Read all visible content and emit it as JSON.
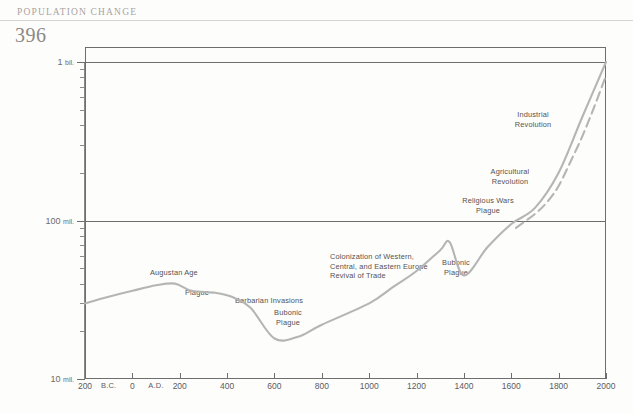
{
  "page": {
    "running_head": "POPULATION CHANGE",
    "folio": "396"
  },
  "chart_data": {
    "type": "line",
    "title": "",
    "xlabel": "",
    "ylabel": "",
    "scale": "log",
    "grid": false,
    "legend": "none",
    "xlim": [
      -200,
      2000
    ],
    "ylim": [
      10000000,
      1000000000
    ],
    "x_ticks": [
      {
        "value": -200,
        "label": "200"
      },
      {
        "value": -100,
        "label": "B.C."
      },
      {
        "value": 0,
        "label": "0"
      },
      {
        "value": 100,
        "label": "A.D."
      },
      {
        "value": 200,
        "label": "200"
      },
      {
        "value": 400,
        "label": "400"
      },
      {
        "value": 600,
        "label": "600"
      },
      {
        "value": 800,
        "label": "800"
      },
      {
        "value": 1000,
        "label": "1000"
      },
      {
        "value": 1200,
        "label": "1200"
      },
      {
        "value": 1400,
        "label": "1400"
      },
      {
        "value": 1600,
        "label": "1600"
      },
      {
        "value": 1800,
        "label": "1800"
      },
      {
        "value": 2000,
        "label": "2000"
      }
    ],
    "y_ticks": [
      {
        "value": 1000000000,
        "label": "1",
        "unit": "bil."
      },
      {
        "value": 100000000,
        "label": "100",
        "unit": "mil."
      },
      {
        "value": 10000000,
        "label": "10",
        "unit": "mil."
      }
    ],
    "series": [
      {
        "name": "European population (estimated)",
        "style": "solid",
        "color": "#b5b5b5",
        "points": [
          {
            "x": -200,
            "y": 30000000
          },
          {
            "x": -100,
            "y": 33000000
          },
          {
            "x": 0,
            "y": 36000000
          },
          {
            "x": 100,
            "y": 39000000
          },
          {
            "x": 180,
            "y": 40000000
          },
          {
            "x": 250,
            "y": 36000000
          },
          {
            "x": 350,
            "y": 35000000
          },
          {
            "x": 420,
            "y": 33000000
          },
          {
            "x": 500,
            "y": 28000000
          },
          {
            "x": 600,
            "y": 18000000
          },
          {
            "x": 700,
            "y": 18500000
          },
          {
            "x": 800,
            "y": 22000000
          },
          {
            "x": 1000,
            "y": 30000000
          },
          {
            "x": 1100,
            "y": 38000000
          },
          {
            "x": 1200,
            "y": 48000000
          },
          {
            "x": 1300,
            "y": 65000000
          },
          {
            "x": 1340,
            "y": 73000000
          },
          {
            "x": 1400,
            "y": 45000000
          },
          {
            "x": 1500,
            "y": 68000000
          },
          {
            "x": 1600,
            "y": 95000000
          },
          {
            "x": 1700,
            "y": 120000000
          },
          {
            "x": 1800,
            "y": 200000000
          },
          {
            "x": 1900,
            "y": 450000000
          },
          {
            "x": 2000,
            "y": 1000000000
          }
        ]
      },
      {
        "name": "Projected / alternate trend",
        "style": "dashed",
        "color": "#b5b5b5",
        "points": [
          {
            "x": 1620,
            "y": 90000000
          },
          {
            "x": 1700,
            "y": 110000000
          },
          {
            "x": 1750,
            "y": 130000000
          },
          {
            "x": 1800,
            "y": 165000000
          },
          {
            "x": 1850,
            "y": 235000000
          },
          {
            "x": 1900,
            "y": 340000000
          },
          {
            "x": 1950,
            "y": 520000000
          },
          {
            "x": 2000,
            "y": 820000000
          }
        ]
      }
    ],
    "annotations": [
      {
        "text": "Augustan Age",
        "x": 150,
        "y": 268
      },
      {
        "text": "Plague",
        "x": 185,
        "y": 288
      },
      {
        "text": "Barbarian Invasions",
        "x": 235,
        "y": 296
      },
      {
        "text": "Bubonic\nPlague",
        "x": 288,
        "y": 308
      },
      {
        "text": "Colonization of Western,\nCentral, and Eastern Europe\nRevival of Trade",
        "x": 330,
        "y": 252
      },
      {
        "text": "Bubonic\nPlague",
        "x": 456,
        "y": 258
      },
      {
        "text": "Religious Wars\nPlague",
        "x": 488,
        "y": 196
      },
      {
        "text": "Agricultural\nRevolution",
        "x": 510,
        "y": 167
      },
      {
        "text": "Industrial\nRevolution",
        "x": 533,
        "y": 110
      }
    ]
  }
}
